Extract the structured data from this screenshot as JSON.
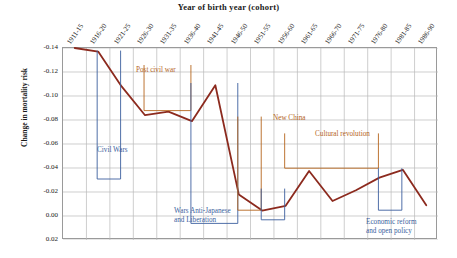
{
  "chart_data": {
    "type": "line",
    "title": "Year of birth year (cohort)",
    "xlabel": "Year of birth year (cohort)",
    "ylabel": "Change in mortality risk",
    "categories": [
      "1911-15",
      "1916-20",
      "1921-25",
      "1926-30",
      "1931-35",
      "1936-40",
      "1941-45",
      "1946-50",
      "1951-55",
      "1956-60",
      "1961-65",
      "1966-70",
      "1971-75",
      "1976-80",
      "1981-85",
      "1986-90"
    ],
    "values": [
      -0.14,
      -0.137,
      -0.108,
      -0.084,
      -0.087,
      -0.079,
      -0.109,
      -0.018,
      -0.0045,
      -0.0085,
      -0.0375,
      -0.0125,
      -0.0215,
      -0.032,
      -0.0385,
      -0.009
    ],
    "yticks": [
      "-0.14",
      "-0.12",
      "-0.10",
      "-0.08",
      "-0.06",
      "-0.04",
      "-0.02",
      "0.00",
      "0.02"
    ],
    "ytick_values": [
      -0.14,
      -0.12,
      -0.1,
      -0.08,
      -0.06,
      -0.04,
      -0.02,
      0.0,
      0.02
    ],
    "ylim": [
      -0.14,
      0.02
    ],
    "y_inverted": true,
    "grid": true,
    "legend": "none",
    "series_color": "#8c2a1e",
    "annotations": [
      {
        "label": "Civil Wars",
        "color": "#3c5f9e",
        "start_category": "1916-20",
        "end_category": "1921-25"
      },
      {
        "label": "Post civil war",
        "color": "#b5651d",
        "start_category": "1926-30",
        "end_category": "1936-40"
      },
      {
        "label": "Wars Anti-Japanese and Liberation",
        "color": "#3c5f9e",
        "start_category": "1936-40",
        "end_category": "1946-50"
      },
      {
        "label": "New China",
        "color": "#b5651d",
        "start_category": "1946-50",
        "end_category": "1951-55"
      },
      {
        "label": "Cultural revolution",
        "color": "#b5651d",
        "start_category": "1956-60",
        "end_category": "1976-80"
      },
      {
        "label": "Economic reform and open policy",
        "color": "#3c5f9e",
        "start_category": "1976-80",
        "end_category": "1981-85"
      }
    ]
  },
  "annotation_text": {
    "civil_wars": "Civil Wars",
    "post_civil_war": "Post civil war",
    "wars_line1": "Wars Anti-Japanese",
    "wars_line2": "and Liberation",
    "new_china": "New China",
    "cultural_revolution": "Cultural revolution",
    "economic_line1": "Economic reform",
    "economic_line2": "and open policy"
  },
  "colors": {
    "series": "#8c2a1e",
    "blue_annotation": "#3c5f9e",
    "orange_annotation": "#b5651d",
    "grid": "#b9b9b9",
    "axis": "#8f8f8f"
  }
}
